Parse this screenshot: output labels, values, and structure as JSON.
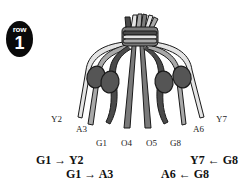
{
  "badge": {
    "word": "row",
    "number": "1"
  },
  "strand_labels": [
    {
      "id": "Y2",
      "x": 51,
      "y": 114
    },
    {
      "id": "A3",
      "x": 76,
      "y": 124
    },
    {
      "id": "G1",
      "x": 96,
      "y": 138
    },
    {
      "id": "O4",
      "x": 121,
      "y": 138
    },
    {
      "id": "O5",
      "x": 146,
      "y": 138
    },
    {
      "id": "G8",
      "x": 170,
      "y": 138
    },
    {
      "id": "A6",
      "x": 193,
      "y": 124
    },
    {
      "id": "Y7",
      "x": 216,
      "y": 114
    }
  ],
  "instructions": [
    {
      "text": "G1 → Y2",
      "x": 36,
      "y": 154
    },
    {
      "text": "G1 → A3",
      "x": 66,
      "y": 168
    },
    {
      "text": "Y7 ← G8",
      "x": 190,
      "y": 154
    },
    {
      "text": "A6 ← G8",
      "x": 161,
      "y": 168
    }
  ],
  "colors": {
    "yellow_strand": "#e4e4e4",
    "aqua_strand": "#a8a8a8",
    "green_strand": "#4a4a4a",
    "orange_strand": "#7a7a7a",
    "knot": "#555555",
    "outline": "#1a1a1a"
  }
}
